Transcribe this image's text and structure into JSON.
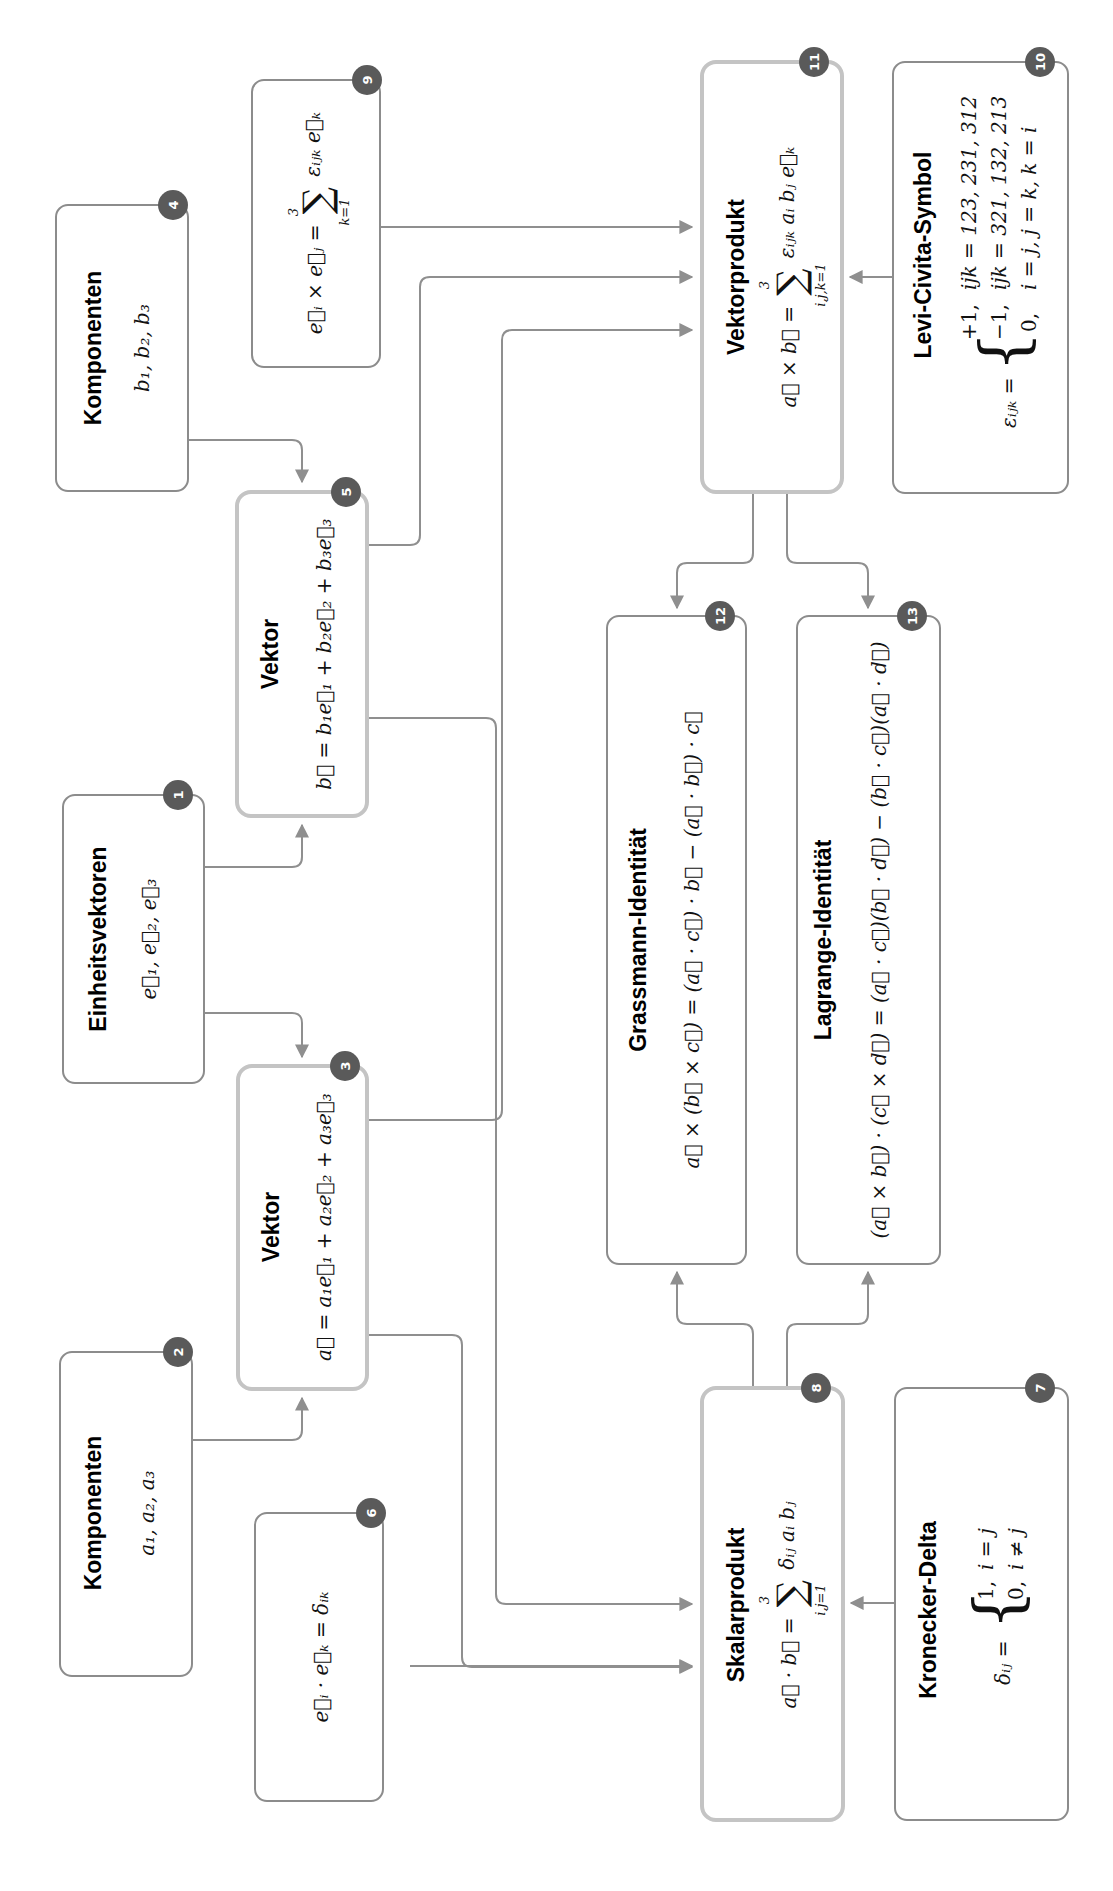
{
  "diagram": {
    "orientation": "rotated-90-ccw",
    "colors": {
      "border_normal": "#8c8c8c",
      "border_key": "#c4c4c4",
      "badge": "#5a5a5a",
      "wire": "#8f8f8f"
    },
    "nodes": {
      "n1": {
        "badge": "1",
        "title": "Einheitsvektoren",
        "formula": "e⃗₁, e⃗₂, e⃗₃"
      },
      "n2": {
        "badge": "2",
        "title": "Komponenten",
        "formula": "a₁, a₂, a₃"
      },
      "n3": {
        "badge": "3",
        "title": "Vektor",
        "formula": "a⃗ = a₁e⃗₁ + a₂e⃗₂ + a₃e⃗₃"
      },
      "n4": {
        "badge": "4",
        "title": "Komponenten",
        "formula": "b₁, b₂, b₃"
      },
      "n5": {
        "badge": "5",
        "title": "Vektor",
        "formula": "b⃗ = b₁e⃗₁ + b₂e⃗₂ + b₃e⃗₃"
      },
      "n6": {
        "badge": "6",
        "title": "",
        "formula": "e⃗ᵢ · e⃗ₖ = δᵢₖ"
      },
      "n7": {
        "badge": "7",
        "title": "Kronecker-Delta",
        "lhs": "δᵢⱼ =",
        "cases": [
          {
            "value": "1,",
            "condition": "i = j"
          },
          {
            "value": "0,",
            "condition": "i ≠ j"
          }
        ]
      },
      "n8": {
        "badge": "8",
        "title": "Skalarprodukt",
        "lhs": "a⃗ · b⃗ =",
        "sum_upper": "3",
        "sum_lower": "i,j=1",
        "summand": "δᵢⱼ aᵢ bⱼ"
      },
      "n9": {
        "badge": "9",
        "lhs": "e⃗ᵢ × e⃗ⱼ =",
        "sum_upper": "3",
        "sum_lower": "k=1",
        "summand": "εᵢⱼₖ e⃗ₖ"
      },
      "n10": {
        "badge": "10",
        "title": "Levi-Civita-Symbol",
        "lhs": "εᵢⱼₖ =",
        "cases": [
          {
            "value": "+1,",
            "condition": "ijk = 123, 231, 312"
          },
          {
            "value": "−1,",
            "condition": "ijk = 321, 132, 213"
          },
          {
            "value": "0,",
            "condition": "i = j, j = k, k = i"
          }
        ]
      },
      "n11": {
        "badge": "11",
        "title": "Vektorprodukt",
        "lhs": "a⃗ × b⃗ =",
        "sum_upper": "3",
        "sum_lower": "i,j,k=1",
        "summand": "εᵢⱼₖ aᵢ bⱼ e⃗ₖ"
      },
      "n12": {
        "badge": "12",
        "title": "Grassmann-Identität",
        "formula": "a⃗ × (b⃗ × c⃗) = (a⃗ · c⃗) · b⃗ − (a⃗ · b⃗) · c⃗"
      },
      "n13": {
        "badge": "13",
        "title": "Lagrange-Identität",
        "formula": "(a⃗ × b⃗) · (c⃗ × d⃗) = (a⃗ · c⃗)(b⃗ · d⃗) − (b⃗ · c⃗)(a⃗ · d⃗)"
      }
    },
    "edges": [
      {
        "from": "1",
        "to": "3"
      },
      {
        "from": "1",
        "to": "5"
      },
      {
        "from": "2",
        "to": "3"
      },
      {
        "from": "4",
        "to": "5"
      },
      {
        "from": "3",
        "to": "8"
      },
      {
        "from": "3",
        "to": "11"
      },
      {
        "from": "5",
        "to": "8"
      },
      {
        "from": "5",
        "to": "11"
      },
      {
        "from": "6",
        "to": "8"
      },
      {
        "from": "7",
        "to": "8"
      },
      {
        "from": "9",
        "to": "11"
      },
      {
        "from": "10",
        "to": "11"
      },
      {
        "from": "8",
        "to": "12"
      },
      {
        "from": "8",
        "to": "13"
      },
      {
        "from": "11",
        "to": "12"
      },
      {
        "from": "11",
        "to": "13"
      }
    ]
  }
}
